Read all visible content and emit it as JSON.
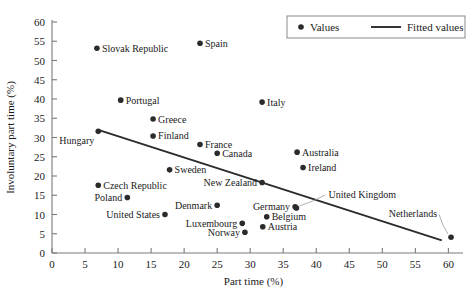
{
  "chart_data": {
    "type": "scatter",
    "title": "",
    "xlabel": "Part time (%)",
    "ylabel": "Involuntary part time (%)",
    "xlim": [
      0,
      61
    ],
    "ylim": [
      0,
      60
    ],
    "xticks": [
      0,
      5,
      10,
      15,
      20,
      25,
      30,
      35,
      40,
      45,
      50,
      55,
      60
    ],
    "yticks": [
      0,
      5,
      10,
      15,
      20,
      25,
      30,
      35,
      40,
      45,
      50,
      55,
      60
    ],
    "grid": false,
    "legend_position": "top-right",
    "legend": [
      {
        "label": "Values",
        "marker": "dot",
        "color": "#2b2b2b"
      },
      {
        "label": "Fitted values",
        "marker": "line",
        "color": "#2b2b2b"
      }
    ],
    "point_color": "#2b2b2b",
    "line_color": "#2b2b2b",
    "points": [
      {
        "label": "Slovak Republic",
        "x": 6.8,
        "y": 53.2,
        "label_pos": "right"
      },
      {
        "label": "Spain",
        "x": 22.4,
        "y": 54.5,
        "label_pos": "right"
      },
      {
        "label": "Portugal",
        "x": 10.4,
        "y": 39.7,
        "label_pos": "right"
      },
      {
        "label": "Italy",
        "x": 31.8,
        "y": 39.2,
        "label_pos": "right"
      },
      {
        "label": "Greece",
        "x": 15.3,
        "y": 34.8,
        "label_pos": "right"
      },
      {
        "label": "Finland",
        "x": 15.3,
        "y": 30.4,
        "label_pos": "right"
      },
      {
        "label": "Hungary",
        "x": 7.0,
        "y": 31.6,
        "label_pos": "belowleft"
      },
      {
        "label": "France",
        "x": 22.4,
        "y": 28.2,
        "label_pos": "right"
      },
      {
        "label": "Canada",
        "x": 25.0,
        "y": 25.9,
        "label_pos": "right"
      },
      {
        "label": "Australia",
        "x": 37.1,
        "y": 26.2,
        "label_pos": "right"
      },
      {
        "label": "Ireland",
        "x": 38.0,
        "y": 22.2,
        "label_pos": "right"
      },
      {
        "label": "Sweden",
        "x": 17.8,
        "y": 21.6,
        "label_pos": "right"
      },
      {
        "label": "Czech Republic",
        "x": 7.0,
        "y": 17.6,
        "label_pos": "right"
      },
      {
        "label": "New Zealand",
        "x": 31.8,
        "y": 18.3,
        "label_pos": "left"
      },
      {
        "label": "Poland",
        "x": 11.4,
        "y": 14.4,
        "label_pos": "left"
      },
      {
        "label": "Denmark",
        "x": 25.0,
        "y": 12.4,
        "label_pos": "left"
      },
      {
        "label": "Germany",
        "x": 36.8,
        "y": 12.0,
        "label_pos": "left"
      },
      {
        "label": "United Kingdom",
        "x": 37.0,
        "y": 11.7,
        "label_pos": "leader-right"
      },
      {
        "label": "United States",
        "x": 17.1,
        "y": 10.0,
        "label_pos": "left"
      },
      {
        "label": "Belgium",
        "x": 32.5,
        "y": 9.4,
        "label_pos": "right"
      },
      {
        "label": "Luxembourg",
        "x": 28.8,
        "y": 7.7,
        "label_pos": "left"
      },
      {
        "label": "Austria",
        "x": 31.9,
        "y": 6.8,
        "label_pos": "right"
      },
      {
        "label": "Norway",
        "x": 29.2,
        "y": 5.4,
        "label_pos": "left"
      },
      {
        "label": "Netherlands",
        "x": 60.4,
        "y": 4.1,
        "label_pos": "leader-left"
      }
    ],
    "fitted_line": {
      "x0": 7.0,
      "y0": 32.0,
      "x1": 59.0,
      "y1": 3.3
    }
  }
}
